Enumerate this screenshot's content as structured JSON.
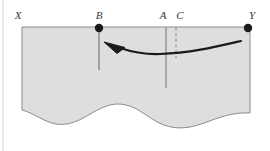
{
  "figure": {
    "canvas": {
      "width": 270,
      "height": 151,
      "background": "#ffffff"
    },
    "frame_border_color": "#d6d6d6",
    "body": {
      "fill": "#dedede",
      "stroke": "#8c8c8c",
      "left": 22,
      "right": 250,
      "top": 27,
      "base_mean": 116
    },
    "labels": [
      {
        "id": "X",
        "text": "X",
        "x": 18,
        "y": 19
      },
      {
        "id": "B",
        "text": "B",
        "x": 99,
        "y": 19
      },
      {
        "id": "A",
        "text": "A",
        "x": 163,
        "y": 19
      },
      {
        "id": "C",
        "text": "C",
        "x": 180,
        "y": 19
      },
      {
        "id": "Y",
        "text": "Y",
        "x": 252,
        "y": 19
      }
    ],
    "markers": [
      {
        "id": "B-dot",
        "cx": 99,
        "cy": 28,
        "r": 4.2,
        "color": "#1a1a1a"
      },
      {
        "id": "Y-dot",
        "cx": 248,
        "cy": 28,
        "r": 4.2,
        "color": "#1a1a1a"
      }
    ],
    "vertical_lines": [
      {
        "id": "B-line",
        "x": 99,
        "y1": 30,
        "y2": 70,
        "color": "#6e6e6e",
        "width": 1.1,
        "style": "solid"
      },
      {
        "id": "A-line",
        "x": 166,
        "y1": 27,
        "y2": 88,
        "color": "#9a9a9a",
        "width": 1.6,
        "style": "solid"
      },
      {
        "id": "C-line",
        "x": 176,
        "y1": 27,
        "y2": 58,
        "color": "#9a9a9a",
        "width": 1.3,
        "style": "dashed"
      }
    ],
    "arrow": {
      "id": "migration-arrow",
      "color": "#1a1a1a",
      "width": 2.2,
      "path": "M 241 41 C 215 47 190 53 160 54 C 145 54.5 132 52 120 48",
      "head": "M 104 42 L 125 47.5 L 117 53.5 Z",
      "direction": "right-to-left"
    },
    "base_path": "M 22 110 C 34 113 44 122 56 124 C 70 126 80 120 92 113 C 104 106 114 102 126 105 C 140 108 150 120 164 125 C 178 130 190 128 204 123 C 218 118 232 112 250 113",
    "colors": {
      "fill": "#dedede",
      "outline": "#8c8c8c",
      "marker": "#1a1a1a",
      "label": "#3b3b3b",
      "guide": "#9a9a9a"
    }
  }
}
